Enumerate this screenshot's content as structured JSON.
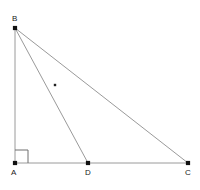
{
  "figure": {
    "type": "geometry-diagram",
    "background_color": "#ffffff",
    "line_color": "#9a9a9a",
    "point_color": "#111111",
    "label_color": "#1a1a1a",
    "right_angle_color": "#6e6e6e",
    "tick_color": "#222222",
    "points": [
      {
        "id": "B",
        "label": "B",
        "x": 15,
        "y": 28,
        "label_x": 12,
        "label_y": 14
      },
      {
        "id": "A",
        "label": "A",
        "x": 15,
        "y": 163,
        "label_x": 11,
        "label_y": 168
      },
      {
        "id": "D",
        "label": "D",
        "x": 88,
        "y": 163,
        "label_x": 85,
        "label_y": 168
      },
      {
        "id": "C",
        "label": "C",
        "x": 188,
        "y": 163,
        "label_x": 185,
        "label_y": 168
      }
    ],
    "segments": [
      {
        "id": "AB",
        "from": "A",
        "to": "B",
        "x1": 15,
        "y1": 163,
        "x2": 15,
        "y2": 28
      },
      {
        "id": "AC",
        "from": "A",
        "to": "C",
        "x1": 15,
        "y1": 163,
        "x2": 188,
        "y2": 163
      },
      {
        "id": "BC",
        "from": "B",
        "to": "C",
        "x1": 15,
        "y1": 28,
        "x2": 188,
        "y2": 163
      },
      {
        "id": "BD",
        "from": "B",
        "to": "D",
        "x1": 15,
        "y1": 28,
        "x2": 88,
        "y2": 163
      }
    ],
    "right_angle": {
      "at": "A",
      "x": 15,
      "y": 163,
      "size": 13
    },
    "tick_mark": {
      "on_segment": "BD",
      "x": 55,
      "y": 85,
      "size": 2.4
    }
  }
}
